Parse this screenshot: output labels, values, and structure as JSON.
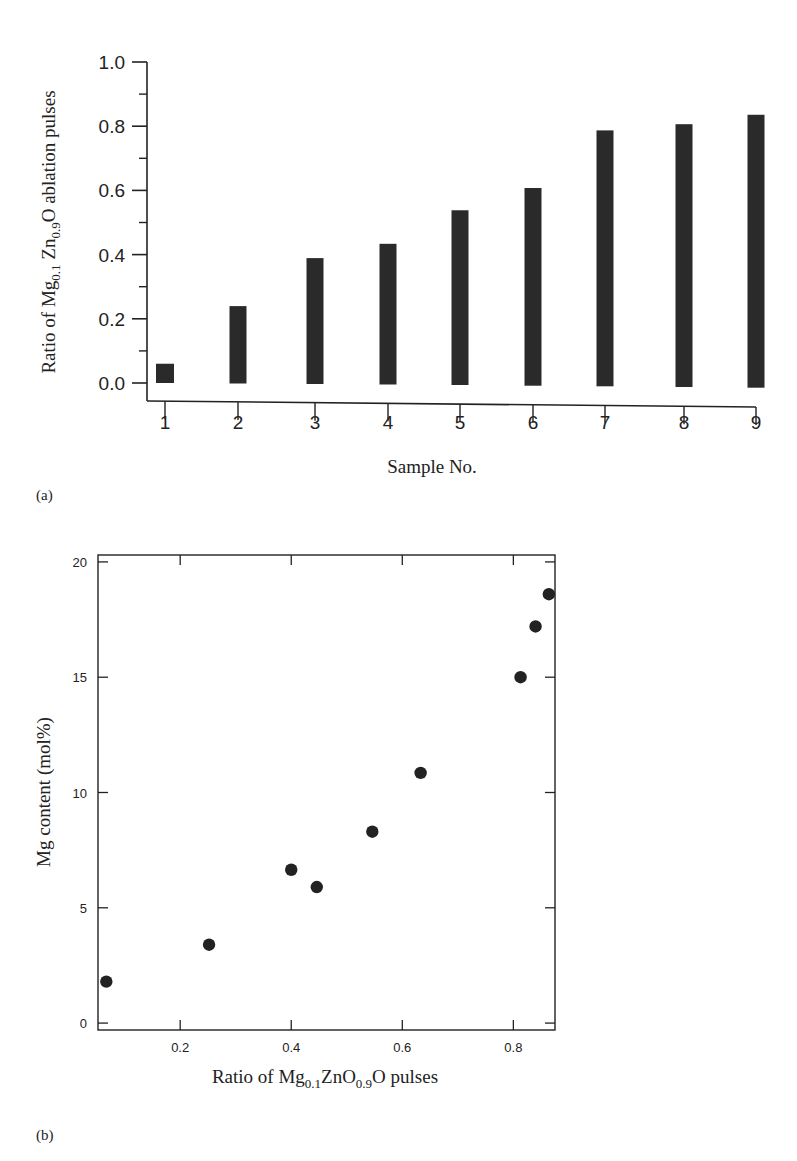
{
  "chart_data": [
    {
      "type": "bar",
      "panel_label": "(a)",
      "title": "",
      "xlabel": "Sample No.",
      "ylabel_parts": [
        "Ratio of Mg",
        "0.1",
        " Zn",
        "0.9",
        "O ablation pulses"
      ],
      "categories": [
        "1",
        "2",
        "3",
        "4",
        "5",
        "6",
        "7",
        "8",
        "9"
      ],
      "values": [
        0.06,
        0.24,
        0.39,
        0.435,
        0.54,
        0.61,
        0.79,
        0.81,
        0.84
      ],
      "ylim": [
        0.0,
        1.0
      ],
      "yticks": [
        "0.0",
        "0.2",
        "0.4",
        "0.6",
        "0.8",
        "1.0"
      ],
      "ytick_values": [
        0.0,
        0.2,
        0.4,
        0.6,
        0.8,
        1.0
      ],
      "grid": false,
      "bar_color": "#2a2a2a"
    },
    {
      "type": "scatter",
      "panel_label": "(b)",
      "title": "",
      "xlabel_parts": [
        "Ratio of Mg",
        "0.1",
        "ZnO",
        "0.9",
        "O pulses"
      ],
      "ylabel": "Mg content (mol%)",
      "x": [
        0.067,
        0.252,
        0.4,
        0.446,
        0.546,
        0.633,
        0.813,
        0.84,
        0.864
      ],
      "y": [
        1.8,
        3.4,
        6.65,
        5.9,
        8.3,
        10.85,
        15.0,
        17.2,
        18.6
      ],
      "xlim": [
        0.052,
        0.875
      ],
      "ylim": [
        -0.3,
        20.3
      ],
      "xticks": [
        "0.2",
        "0.4",
        "0.6",
        "0.8"
      ],
      "xtick_values": [
        0.2,
        0.4,
        0.6,
        0.8
      ],
      "yticks": [
        "0",
        "5",
        "10",
        "15",
        "20"
      ],
      "ytick_values": [
        0,
        5,
        10,
        15,
        20
      ],
      "grid": false,
      "marker_color": "#222222"
    }
  ]
}
